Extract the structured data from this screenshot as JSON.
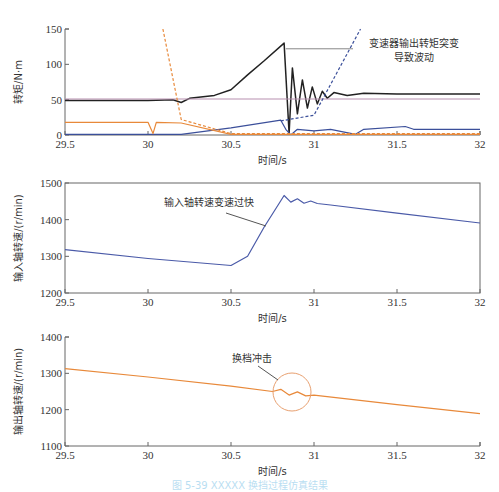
{
  "chart_data": [
    {
      "type": "line",
      "title": "",
      "xlabel": "时间/s",
      "ylabel": "转矩/N·m",
      "xlim": [
        29.5,
        32
      ],
      "ylim": [
        0,
        150
      ],
      "xticks": [
        "29.5",
        "30",
        "30.5",
        "31",
        "31.5",
        "32"
      ],
      "yticks": [
        "0",
        "50",
        "100",
        "150"
      ],
      "grid": false,
      "annotations": [
        {
          "text_line1": "变速器输出转矩突变",
          "text_line2": "导致波动",
          "x": 30.82,
          "y": 122
        }
      ],
      "series": [
        {
          "name": "transmission-output-torque",
          "color": "#222222",
          "style": "solid",
          "x": [
            29.5,
            30.0,
            30.15,
            30.2,
            30.25,
            30.4,
            30.5,
            30.6,
            30.7,
            30.82,
            30.85,
            30.87,
            30.9,
            30.93,
            30.96,
            30.99,
            31.02,
            31.05,
            31.08,
            31.12,
            31.2,
            31.3,
            31.5,
            32.0
          ],
          "y": [
            49,
            49,
            50,
            46,
            52,
            56,
            64,
            85,
            105,
            130,
            2,
            95,
            30,
            78,
            38,
            68,
            44,
            62,
            52,
            60,
            56,
            59,
            58,
            58
          ]
        },
        {
          "name": "reference-torque",
          "color": "#b88fb0",
          "style": "solid",
          "x": [
            29.5,
            32.0
          ],
          "y": [
            51,
            51
          ]
        },
        {
          "name": "clutch-torque-on",
          "color": "#3b4f9a",
          "style": "solid",
          "x": [
            29.5,
            30.2,
            30.5,
            30.8,
            30.83,
            30.86,
            30.9,
            31.0,
            31.1,
            31.25,
            31.3,
            31.55,
            31.6,
            32.0
          ],
          "y": [
            1,
            1,
            10,
            21,
            8,
            0,
            8,
            6,
            8,
            1,
            8,
            12,
            8,
            8
          ]
        },
        {
          "name": "clutch-torque-off",
          "color": "#e8893a",
          "style": "solid",
          "x": [
            29.5,
            30.0,
            30.03,
            30.05,
            30.2,
            30.5,
            32.0
          ],
          "y": [
            18,
            18,
            2,
            18,
            17,
            1,
            1
          ]
        },
        {
          "name": "clutch-target-off",
          "color": "#e8893a",
          "style": "dashed",
          "x": [
            30.09,
            30.2,
            30.5,
            32.0
          ],
          "y": [
            150,
            22,
            2,
            2
          ]
        },
        {
          "name": "clutch-target-on",
          "color": "#3b4f9a",
          "style": "dashed",
          "x": [
            30.8,
            31.0,
            31.28
          ],
          "y": [
            20,
            28,
            150
          ]
        }
      ]
    },
    {
      "type": "line",
      "title": "",
      "xlabel": "时间/s",
      "ylabel": "输入轴转速/(r/min)",
      "xlim": [
        29.5,
        32
      ],
      "ylim": [
        1200,
        1500
      ],
      "xticks": [
        "29.5",
        "30",
        "30.5",
        "31",
        "31.5",
        "32"
      ],
      "yticks": [
        "1200",
        "1300",
        "1400",
        "1500"
      ],
      "grid": false,
      "annotations": [
        {
          "text": "输入轴转速变速过快",
          "x": 30.1,
          "y": 1450
        }
      ],
      "series": [
        {
          "name": "input-shaft-speed",
          "color": "#4a5aa8",
          "style": "solid",
          "x": [
            29.5,
            30.0,
            30.5,
            30.6,
            30.7,
            30.82,
            30.86,
            30.9,
            30.94,
            30.98,
            31.02,
            31.1,
            31.5,
            32.0
          ],
          "y": [
            1318,
            1294,
            1275,
            1300,
            1380,
            1466,
            1448,
            1457,
            1445,
            1451,
            1444,
            1440,
            1418,
            1391
          ]
        }
      ]
    },
    {
      "type": "line",
      "title": "",
      "xlabel": "时间/s",
      "ylabel": "输出轴转速/(r/min)",
      "xlim": [
        29.5,
        32
      ],
      "ylim": [
        1100,
        1400
      ],
      "xticks": [
        "29.5",
        "30",
        "30.5",
        "31",
        "31.5",
        "32"
      ],
      "yticks": [
        "1100",
        "1200",
        "1300",
        "1400"
      ],
      "grid": false,
      "annotations": [
        {
          "text": "换档冲击",
          "x": 30.8,
          "y": 1340
        }
      ],
      "series": [
        {
          "name": "output-shaft-speed",
          "color": "#e8893a",
          "style": "solid",
          "x": [
            29.5,
            30.0,
            30.5,
            30.75,
            30.8,
            30.85,
            30.9,
            30.95,
            31.0,
            31.5,
            32.0
          ],
          "y": [
            1313,
            1290,
            1265,
            1250,
            1256,
            1240,
            1249,
            1238,
            1240,
            1214,
            1189
          ]
        }
      ]
    }
  ],
  "figure": {
    "caption": "图 5-39 XXXXX 换挡过程仿真结果"
  }
}
